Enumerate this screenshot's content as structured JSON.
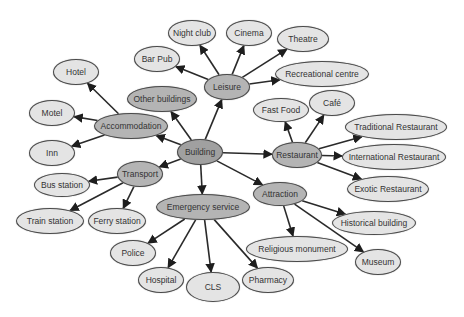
{
  "diagram": {
    "colors": {
      "light": "#e4e4e4",
      "mid": "#b4b4b4",
      "dark": "#a0a0a0",
      "stroke": "#4a4a4a",
      "edge": "#2a2a2a"
    },
    "nodes": [
      {
        "id": "building",
        "label": "Building",
        "cx": 200,
        "cy": 152,
        "rx": 23,
        "ry": 13,
        "tone": "dark"
      },
      {
        "id": "leisure",
        "label": "Leisure",
        "cx": 227,
        "cy": 87,
        "rx": 23,
        "ry": 13,
        "tone": "mid"
      },
      {
        "id": "other-buildings",
        "label": "Other buildings",
        "cx": 162,
        "cy": 99,
        "rx": 35,
        "ry": 13,
        "tone": "mid"
      },
      {
        "id": "accommodation",
        "label": "Accommodation",
        "cx": 131,
        "cy": 126,
        "rx": 37,
        "ry": 13,
        "tone": "mid"
      },
      {
        "id": "restaurant",
        "label": "Restaurant",
        "cx": 297,
        "cy": 155,
        "rx": 25,
        "ry": 13,
        "tone": "mid"
      },
      {
        "id": "transport",
        "label": "Transport",
        "cx": 140,
        "cy": 174,
        "rx": 23,
        "ry": 13,
        "tone": "mid"
      },
      {
        "id": "emergency-service",
        "label": "Emergency service",
        "cx": 203,
        "cy": 207,
        "rx": 47,
        "ry": 13,
        "tone": "mid"
      },
      {
        "id": "attraction",
        "label": "Attraction",
        "cx": 280,
        "cy": 194,
        "rx": 27,
        "ry": 12,
        "tone": "mid"
      },
      {
        "id": "night-club",
        "label": "Night club",
        "cx": 192,
        "cy": 33,
        "rx": 24,
        "ry": 13,
        "tone": "light"
      },
      {
        "id": "cinema",
        "label": "Cinema",
        "cx": 249,
        "cy": 33,
        "rx": 23,
        "ry": 13,
        "tone": "light"
      },
      {
        "id": "bar-pub",
        "label": "Bar Pub",
        "cx": 157,
        "cy": 59,
        "rx": 23,
        "ry": 13,
        "tone": "light"
      },
      {
        "id": "theatre",
        "label": "Theatre",
        "cx": 303,
        "cy": 39,
        "rx": 26,
        "ry": 13,
        "tone": "light"
      },
      {
        "id": "recreational-centre",
        "label": "Recreational centre",
        "cx": 322,
        "cy": 74,
        "rx": 47,
        "ry": 13,
        "tone": "light"
      },
      {
        "id": "hotel",
        "label": "Hotel",
        "cx": 76,
        "cy": 72,
        "rx": 23,
        "ry": 13,
        "tone": "light"
      },
      {
        "id": "motel",
        "label": "Motel",
        "cx": 52,
        "cy": 113,
        "rx": 23,
        "ry": 13,
        "tone": "light"
      },
      {
        "id": "inn",
        "label": "Inn",
        "cx": 52,
        "cy": 153,
        "rx": 23,
        "ry": 13,
        "tone": "light"
      },
      {
        "id": "fast-food",
        "label": "Fast Food",
        "cx": 281,
        "cy": 110,
        "rx": 28,
        "ry": 12,
        "tone": "light"
      },
      {
        "id": "cafe",
        "label": "Café",
        "cx": 332,
        "cy": 103,
        "rx": 23,
        "ry": 13,
        "tone": "light"
      },
      {
        "id": "traditional-restaurant",
        "label": "Traditional Restaurant",
        "cx": 396,
        "cy": 127,
        "rx": 51,
        "ry": 13,
        "tone": "light"
      },
      {
        "id": "international-restaurant",
        "label": "International Restaurant",
        "cx": 394,
        "cy": 157,
        "rx": 52,
        "ry": 13,
        "tone": "light"
      },
      {
        "id": "exotic-restaurant",
        "label": "Exotic Restaurant",
        "cx": 388,
        "cy": 189,
        "rx": 41,
        "ry": 13,
        "tone": "light"
      },
      {
        "id": "bus-station",
        "label": "Bus station",
        "cx": 62,
        "cy": 185,
        "rx": 28,
        "ry": 12,
        "tone": "light"
      },
      {
        "id": "train-station",
        "label": "Train station",
        "cx": 50,
        "cy": 221,
        "rx": 34,
        "ry": 13,
        "tone": "light"
      },
      {
        "id": "ferry-station",
        "label": "Ferry station",
        "cx": 117,
        "cy": 221,
        "rx": 29,
        "ry": 13,
        "tone": "light"
      },
      {
        "id": "police",
        "label": "Police",
        "cx": 133,
        "cy": 253,
        "rx": 23,
        "ry": 13,
        "tone": "light"
      },
      {
        "id": "hospital",
        "label": "Hospital",
        "cx": 161,
        "cy": 280,
        "rx": 23,
        "ry": 13,
        "tone": "light"
      },
      {
        "id": "cls",
        "label": "CLS",
        "cx": 213,
        "cy": 287,
        "rx": 27,
        "ry": 15,
        "tone": "light"
      },
      {
        "id": "pharmacy",
        "label": "Pharmacy",
        "cx": 268,
        "cy": 280,
        "rx": 26,
        "ry": 13,
        "tone": "light"
      },
      {
        "id": "historical-building",
        "label": "Historical building",
        "cx": 374,
        "cy": 223,
        "rx": 42,
        "ry": 12,
        "tone": "light"
      },
      {
        "id": "religious-monument",
        "label": "Religious monument",
        "cx": 297,
        "cy": 249,
        "rx": 51,
        "ry": 13,
        "tone": "light"
      },
      {
        "id": "museum",
        "label": "Museum",
        "cx": 378,
        "cy": 262,
        "rx": 23,
        "ry": 13,
        "tone": "light"
      }
    ],
    "edges": [
      [
        "building",
        "leisure"
      ],
      [
        "building",
        "other-buildings"
      ],
      [
        "building",
        "accommodation"
      ],
      [
        "building",
        "restaurant"
      ],
      [
        "building",
        "transport"
      ],
      [
        "building",
        "emergency-service"
      ],
      [
        "building",
        "attraction"
      ],
      [
        "leisure",
        "night-club"
      ],
      [
        "leisure",
        "cinema"
      ],
      [
        "leisure",
        "bar-pub"
      ],
      [
        "leisure",
        "theatre"
      ],
      [
        "leisure",
        "recreational-centre"
      ],
      [
        "accommodation",
        "hotel"
      ],
      [
        "accommodation",
        "motel"
      ],
      [
        "accommodation",
        "inn"
      ],
      [
        "restaurant",
        "fast-food"
      ],
      [
        "restaurant",
        "cafe"
      ],
      [
        "restaurant",
        "traditional-restaurant"
      ],
      [
        "restaurant",
        "international-restaurant"
      ],
      [
        "restaurant",
        "exotic-restaurant"
      ],
      [
        "transport",
        "bus-station"
      ],
      [
        "transport",
        "train-station"
      ],
      [
        "transport",
        "ferry-station"
      ],
      [
        "emergency-service",
        "police"
      ],
      [
        "emergency-service",
        "hospital"
      ],
      [
        "emergency-service",
        "cls"
      ],
      [
        "emergency-service",
        "pharmacy"
      ],
      [
        "attraction",
        "historical-building"
      ],
      [
        "attraction",
        "religious-monument"
      ],
      [
        "attraction",
        "museum"
      ]
    ]
  }
}
